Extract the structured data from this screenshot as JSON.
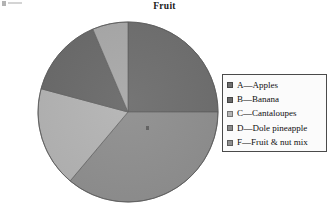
{
  "title": "Fruit",
  "chart_data": {
    "type": "pie",
    "title": "Fruit",
    "labels": [
      "A—Apples",
      "B—Banana",
      "C—Cantaloupes",
      "D—Dole pineapple",
      "F—Fruit & nut mix"
    ],
    "short_labels": [
      "A",
      "B",
      "C",
      "D",
      "F"
    ],
    "names": [
      "Apples",
      "Banana",
      "Cantaloupes",
      "Dole pineapple",
      "Fruit & nut mix"
    ],
    "values": [
      25,
      14,
      18,
      7,
      36
    ],
    "percentages": [
      25,
      14,
      18,
      7,
      36
    ],
    "colors": [
      "#6e6e6e",
      "#6a6a6a",
      "#b4b4b4",
      "#a9a9a9",
      "#8f8f8f"
    ],
    "start_angle_deg": 0,
    "direction": "clockwise",
    "legend_position": "right",
    "grid": false,
    "slice_angles_deg": [
      {
        "label": "A—Apples",
        "start": 0,
        "end": 90
      },
      {
        "label": "F—Fruit & nut mix",
        "start": 90,
        "end": 220
      },
      {
        "label": "C—Cantaloupes",
        "start": 220,
        "end": 285
      },
      {
        "label": "B—Banana",
        "start": 285,
        "end": 337
      },
      {
        "label": "D—Dole pineapple",
        "start": 337,
        "end": 360
      }
    ]
  },
  "legend": {
    "items": [
      {
        "label": "A—Apples",
        "color": "#6e6e6e"
      },
      {
        "label": "B—Banana",
        "color": "#6a6a6a"
      },
      {
        "label": "C—Cantaloupes",
        "color": "#b4b4b4"
      },
      {
        "label": "D—Dole pineapple",
        "color": "#8b8b8b"
      },
      {
        "label": "F—Fruit & nut mix",
        "color": "#8f8f8f"
      }
    ]
  }
}
